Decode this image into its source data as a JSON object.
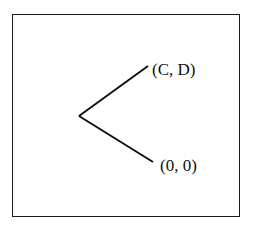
{
  "diagram": {
    "type": "game-tree",
    "nodes": [
      {
        "id": "root",
        "label": ""
      },
      {
        "id": "upper-leaf",
        "label": "(C, D)"
      },
      {
        "id": "lower-leaf",
        "label": "(0, 0)"
      }
    ],
    "edges": [
      {
        "from": "root",
        "to": "upper-leaf"
      },
      {
        "from": "root",
        "to": "lower-leaf"
      }
    ]
  },
  "labels": {
    "upper": "(C, D)",
    "lower": "(0, 0)"
  },
  "colors": {
    "line": "#111111",
    "border": "#1a1a1a",
    "background": "#ffffff"
  }
}
